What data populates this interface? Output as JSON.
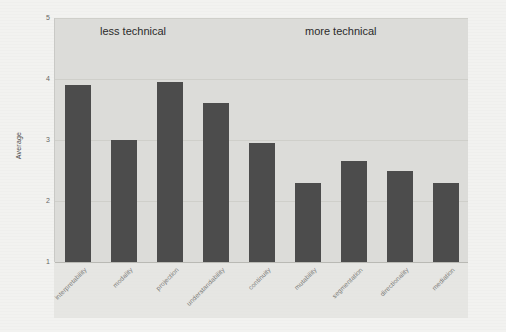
{
  "chart_data": {
    "type": "bar",
    "title": "",
    "xlabel": "",
    "ylabel": "Average",
    "ylim": [
      1,
      5
    ],
    "yticks": [
      "1",
      "2",
      "3",
      "4",
      "5"
    ],
    "grid": true,
    "legend": "none",
    "categories": [
      "interpretability",
      "modality",
      "projection",
      "understandability",
      "continuity",
      "mutability",
      "segmentation",
      "directionality",
      "mediation"
    ],
    "values": [
      3.9,
      3.0,
      3.95,
      3.6,
      2.95,
      2.3,
      2.65,
      2.5,
      2.3
    ],
    "annotations": [
      {
        "text": "less technical",
        "position": "top-left"
      },
      {
        "text": "more technical",
        "position": "top-right"
      }
    ],
    "colors": {
      "bar": "#4c4c4c",
      "plot_background": "#dcdcd9",
      "figure_background": "#f2f2f0",
      "gridline": "#cfcfca",
      "tick_label": "#7a7a77",
      "annotation_text": "#2b2b2b"
    }
  }
}
